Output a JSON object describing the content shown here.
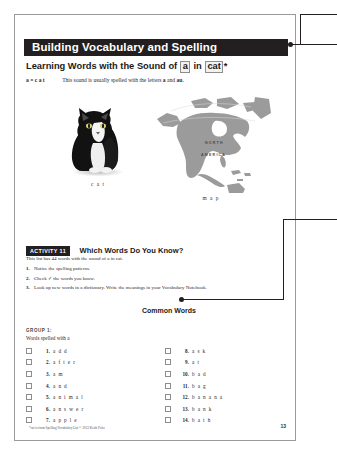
{
  "document": {
    "banner_title": "Building Vocabulary and Spelling",
    "subtitle": {
      "before": "Learning Words with the Sound of",
      "boxed_1": "a",
      "middle": "in",
      "boxed_2": "cat",
      "asterisk": "*"
    },
    "phonics": {
      "key": "a = c a t",
      "sentence_before": "This sound is usually spelled with the letters ",
      "letter_1": "a",
      "sentence_middle": " and ",
      "letter_2": "au",
      "sentence_end": "."
    },
    "figures": [
      {
        "name": "cat-photo",
        "caption": "c a t",
        "alt": "black and white cat sitting"
      },
      {
        "name": "north-america-map",
        "caption": "m a p",
        "alt": "gray map of North America",
        "labels": [
          "NORTH",
          "AMERICA"
        ]
      }
    ],
    "activity": {
      "badge": "ACTIVITY 11",
      "title": "Which Words Do You Know?",
      "intro": "This list has 44 words with the sound of a in cat.",
      "steps": [
        {
          "num": "1.",
          "text": "Notice the spelling patterns."
        },
        {
          "num": "2.",
          "text": "Check ✓ the words you know."
        },
        {
          "num": "3.",
          "text": "Look up new words in a dictionary. Write the meanings in your Vocabulary Notebook."
        }
      ]
    },
    "callout": {
      "label": "Common Words"
    },
    "group": {
      "heading": "GROUP 1:",
      "subheading": "Words spelled with a"
    },
    "words_left": [
      {
        "num": "1.",
        "word": "a d d"
      },
      {
        "num": "2.",
        "word": "a f t e r"
      },
      {
        "num": "3.",
        "word": "a m"
      },
      {
        "num": "4.",
        "word": "a n d"
      },
      {
        "num": "5.",
        "word": "a n i m a l"
      },
      {
        "num": "6.",
        "word": "a n s w e r"
      },
      {
        "num": "7.",
        "word": "a p p l e"
      }
    ],
    "words_right": [
      {
        "num": "8.",
        "word": "a s k"
      },
      {
        "num": "9.",
        "word": "a t"
      },
      {
        "num": "10.",
        "word": "b a d"
      },
      {
        "num": "11.",
        "word": "b a g"
      },
      {
        "num": "12.",
        "word": "b a n a n a"
      },
      {
        "num": "13.",
        "word": "b a n k"
      },
      {
        "num": "14.",
        "word": "b a t h"
      }
    ],
    "footnote": "*cat is from Spelling Vocabulary List © 2013 Keith Folse",
    "page_number": "13"
  },
  "colors": {
    "banner_bg": "#231f20",
    "banner_text": "#ffffff",
    "page_bg": "#ffffff",
    "page_border": "#9a9a9a",
    "map_fill": "#9b9b9b",
    "checkbox_border": "#8d8d8d",
    "leader_line": "#231f20",
    "canvas_bg": "#ffffff"
  }
}
